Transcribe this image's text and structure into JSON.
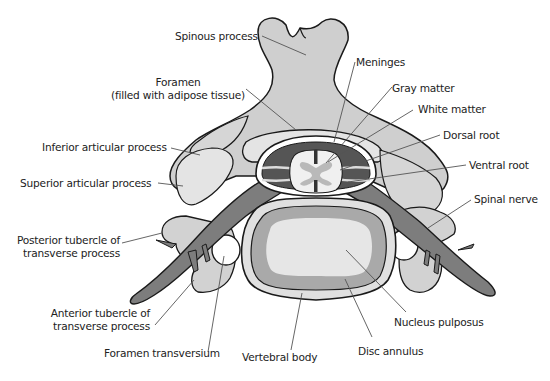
{
  "diagram": {
    "colors": {
      "bone": "#cfcfcf",
      "bone_light": "#e4e4e4",
      "outline": "#1a1a1a",
      "nerve": "#7d7d7d",
      "csf_dark": "#555555",
      "white_matter": "#f0f0f0",
      "gray_matter": "#b9b9b9",
      "annulus": "#a9a9a9",
      "nucleus": "#e6e6e6",
      "leader": "#555555",
      "text": "#222222"
    },
    "labels": {
      "spinous_process": "Spinous process",
      "foramen_line1": "Foramen",
      "foramen_line2": "(filled with adipose tissue)",
      "inferior_articular": "Inferior articular process",
      "superior_articular": "Superior articular process",
      "posterior_tubercle_line1": "Posterior tubercle of",
      "posterior_tubercle_line2": "transverse process",
      "anterior_tubercle_line1": "Anterior tubercle of",
      "anterior_tubercle_line2": "transverse process",
      "foramen_transversium": "Foramen transversium",
      "vertebral_body": "Vertebral body",
      "disc_annulus": "Disc annulus",
      "nucleus_pulposus": "Nucleus pulposus",
      "spinal_nerve": "Spinal nerve",
      "ventral_root": "Ventral root",
      "dorsal_root": "Dorsal root",
      "white_matter": "White matter",
      "gray_matter": "Gray matter",
      "meninges": "Meninges"
    }
  }
}
